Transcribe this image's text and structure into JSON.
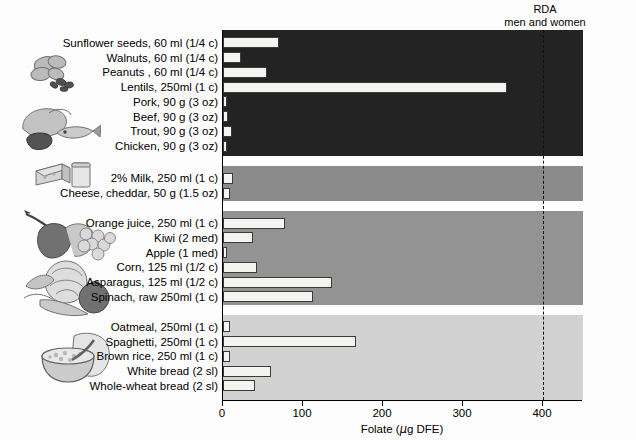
{
  "annotation": {
    "rda_line1": "RDA",
    "rda_line2": "men and women"
  },
  "axis": {
    "x_title_prefix": "Folate (",
    "x_title_mu": "µ",
    "x_title_suffix": "g DFE)",
    "x_title_full": "Folate (µg DFE)",
    "ticks": [
      "0",
      "100",
      "200",
      "300",
      "400"
    ]
  },
  "illustrations": [
    {
      "name": "nuts-seeds-illustration"
    },
    {
      "name": "meat-fish-poultry-illustration"
    },
    {
      "name": "cheese-milk-illustration"
    },
    {
      "name": "fruit-illustration"
    },
    {
      "name": "vegetables-illustration"
    },
    {
      "name": "grains-bread-cereal-illustration"
    }
  ],
  "chart_data": {
    "type": "bar",
    "orientation": "horizontal",
    "title": "",
    "xlabel": "Folate (µg DFE)",
    "ylabel": "",
    "xlim": [
      0,
      450
    ],
    "grid": false,
    "legend": "none",
    "annotations": [
      {
        "label": "RDA men and women",
        "type": "vline",
        "value": 400,
        "style": "dashed"
      }
    ],
    "groups": [
      {
        "name": "Meat, fish, poultry, nuts, seeds and legumes",
        "band_color": "#232323",
        "categories": [
          "Sunflower seeds, 60 ml (1/4 c)",
          "Walnuts, 60 ml (1/4 c)",
          "Peanuts , 60 ml (1/4 c)",
          "Lentils, 250ml (1 c)",
          "Pork, 90 g (3 oz)",
          "Beef, 90 g (3 oz)",
          "Trout, 90 g (3 oz)",
          "Chicken, 90 g (3 oz)"
        ],
        "values": [
          70,
          23,
          55,
          355,
          4,
          6,
          11,
          3
        ]
      },
      {
        "name": "Milk and milk products",
        "band_color": "#8b8b8b",
        "categories": [
          "2% Milk, 250 ml (1 c)",
          "Cheese, cheddar, 50 g (1.5 oz)"
        ],
        "values": [
          12,
          9
        ]
      },
      {
        "name": "Vegetables and fruit",
        "band_color": "#939393",
        "categories": [
          "Orange juice, 250 ml (1 c)",
          "Kiwi (2 med)",
          "Apple (1 med)",
          "Corn, 125 ml (1/2 c)",
          "Asparagus, 125 ml (1/2 c)",
          "Spinach, raw 250ml (1 c)"
        ],
        "values": [
          77,
          38,
          4,
          42,
          136,
          112
        ]
      },
      {
        "name": "Grain products",
        "band_color": "#d2d2d2",
        "categories": [
          "Oatmeal, 250ml (1 c)",
          "Spaghetti, 250ml (1 c)",
          "Brown rice, 250 ml (1 c)",
          "White bread (2 sl)",
          "Whole-wheat bread (2 sl)"
        ],
        "values": [
          9,
          166,
          9,
          60,
          40
        ]
      }
    ]
  }
}
